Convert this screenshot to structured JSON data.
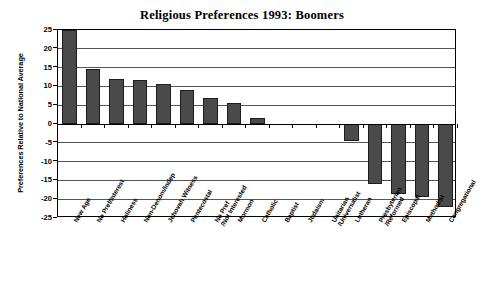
{
  "chart_data": {
    "type": "bar",
    "title": "Religious Preferences 1993: Boomers",
    "xlabel": "",
    "ylabel": "Preferences Relative to National Average",
    "ylim": [
      -25,
      25
    ],
    "ytick_values": [
      25,
      20,
      15,
      10,
      5,
      0,
      -5,
      -10,
      -15,
      -20,
      -25
    ],
    "ytick_labels": [
      "25",
      "20",
      "15",
      "10",
      "5",
      "0",
      "-5",
      "-10",
      "-15",
      "-20",
      "-25"
    ],
    "grid": true,
    "legend": "none",
    "bar_color": "#4a4a4a",
    "categories": [
      "New Age",
      "No Pref/Interest",
      "Holiness",
      "Non-Denom/Indep",
      "Jehovah Witness",
      "Pentecostal",
      "No Pref\n/Not Interested",
      "Mormon",
      "Catholic",
      "Baptist",
      "Judaism",
      "Unitarian\n/Universalist",
      "Lutheran",
      "Presbyterian\n/Reformed",
      "Episcopal",
      "Methodist",
      "Congregational"
    ],
    "values": [
      25,
      14.5,
      12,
      11.7,
      10.7,
      9,
      7,
      5.5,
      1.5,
      0,
      0,
      0,
      -4.5,
      -16,
      -18.5,
      -19.3,
      -22
    ]
  }
}
